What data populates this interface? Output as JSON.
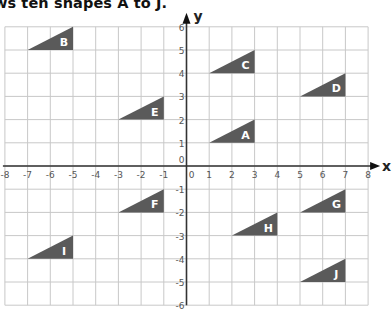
{
  "title": "ws ten shapes A to J.",
  "colors": {
    "shape_fill": "#5a5a5a",
    "grid": "#c8c8c8",
    "axis": "#333333",
    "label": "#ffffff"
  },
  "axes": {
    "x_label": "x",
    "y_label": "y",
    "x_range": [
      -8,
      8
    ],
    "y_range": [
      -6,
      6
    ],
    "x_ticks": [
      "-8",
      "-7",
      "-6",
      "-5",
      "-4",
      "-3",
      "-2",
      "-1",
      "0",
      "1",
      "2",
      "3",
      "4",
      "5",
      "6",
      "7",
      "8"
    ],
    "y_ticks": [
      "-6",
      "-5",
      "-4",
      "-3",
      "-2",
      "-1",
      "0",
      "1",
      "2",
      "3",
      "4",
      "5",
      "6"
    ]
  },
  "shapes": [
    {
      "label": "A",
      "points": [
        [
          1,
          1
        ],
        [
          3,
          1
        ],
        [
          3,
          2
        ]
      ]
    },
    {
      "label": "B",
      "points": [
        [
          -7,
          5
        ],
        [
          -5,
          5
        ],
        [
          -5,
          6
        ]
      ]
    },
    {
      "label": "C",
      "points": [
        [
          1,
          4
        ],
        [
          3,
          4
        ],
        [
          3,
          5
        ]
      ]
    },
    {
      "label": "D",
      "points": [
        [
          5,
          3
        ],
        [
          7,
          3
        ],
        [
          7,
          4
        ]
      ]
    },
    {
      "label": "E",
      "points": [
        [
          -3,
          2
        ],
        [
          -1,
          2
        ],
        [
          -1,
          3
        ]
      ]
    },
    {
      "label": "F",
      "points": [
        [
          -3,
          -2
        ],
        [
          -1,
          -2
        ],
        [
          -1,
          -1
        ]
      ]
    },
    {
      "label": "G",
      "points": [
        [
          5,
          -2
        ],
        [
          7,
          -2
        ],
        [
          7,
          -1
        ]
      ]
    },
    {
      "label": "H",
      "points": [
        [
          2,
          -3
        ],
        [
          4,
          -3
        ],
        [
          4,
          -2
        ]
      ]
    },
    {
      "label": "I",
      "points": [
        [
          -7,
          -4
        ],
        [
          -5,
          -4
        ],
        [
          -5,
          -3
        ]
      ]
    },
    {
      "label": "J",
      "points": [
        [
          5,
          -5
        ],
        [
          7,
          -5
        ],
        [
          7,
          -4
        ]
      ]
    }
  ]
}
